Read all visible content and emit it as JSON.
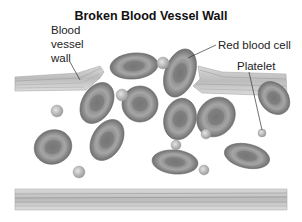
{
  "title": "Broken Blood Vessel Wall",
  "labels": {
    "vessel_wall_line1": "Blood",
    "vessel_wall_line2": "vessel",
    "vessel_wall_line3": "wall",
    "red_blood_cell": "Red blood cell",
    "platelet": "Platelet"
  },
  "colors": {
    "cell_dark": "#6e6e6e",
    "cell_mid": "#8c8c8c",
    "cell_light": "#b4b4b4",
    "wall": "#c8c8c8",
    "wall_line": "#9a9a9a",
    "text": "#222222"
  },
  "counts": {
    "red_blood_cells": 11,
    "platelets": 8
  }
}
